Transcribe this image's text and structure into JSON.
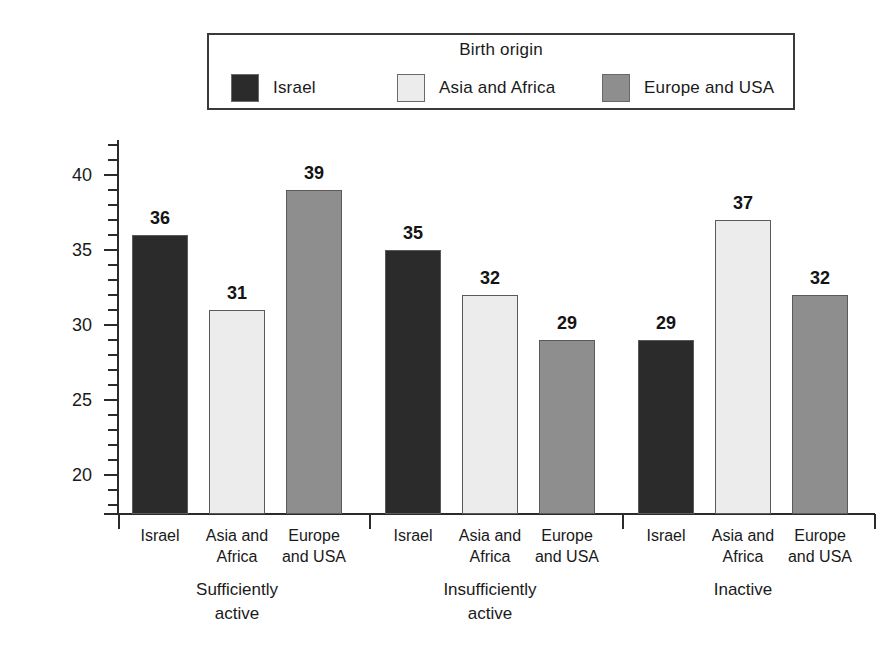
{
  "chart_data": {
    "type": "bar",
    "title": "",
    "xlabel": "",
    "ylabel": "Percent",
    "ylim": [
      17.4,
      42
    ],
    "grid": false,
    "legend_title": "Birth origin",
    "legend_position": "top",
    "categories": [
      "Sufficiently active",
      "Insufficiently active",
      "Inactive"
    ],
    "category_lines": [
      [
        "Sufficiently",
        "active"
      ],
      [
        "Insufficiently",
        "active"
      ],
      [
        "Inactive",
        ""
      ]
    ],
    "series": [
      {
        "name": "Israel",
        "color": "#2b2b2b",
        "values": [
          36,
          35,
          29
        ]
      },
      {
        "name": "Asia and Africa",
        "color": "#ececec",
        "values": [
          31,
          32,
          37
        ]
      },
      {
        "name": "Europe and USA",
        "color": "#8e8e8e",
        "values": [
          39,
          29,
          32
        ]
      }
    ],
    "series_label_lines": [
      [
        "Israel",
        ""
      ],
      [
        "Asia and",
        "Africa"
      ],
      [
        "Europe",
        "and USA"
      ]
    ],
    "y_ticks_major": [
      20,
      25,
      30,
      35,
      40
    ],
    "y_tick_labels": [
      "20",
      "25",
      "30",
      "35",
      "40"
    ],
    "y_ticks_minor_step": 1,
    "bar_outline_color": "#5a5a5a",
    "axis_color": "#2b2b2b"
  },
  "legend": {
    "title": "Birth origin",
    "items": [
      {
        "label": "Israel",
        "color": "#2b2b2b"
      },
      {
        "label": "Asia and Africa",
        "color": "#ececec"
      },
      {
        "label": "Europe and USA",
        "color": "#8e8e8e"
      }
    ]
  },
  "axis": {
    "y_title": "Percent"
  }
}
